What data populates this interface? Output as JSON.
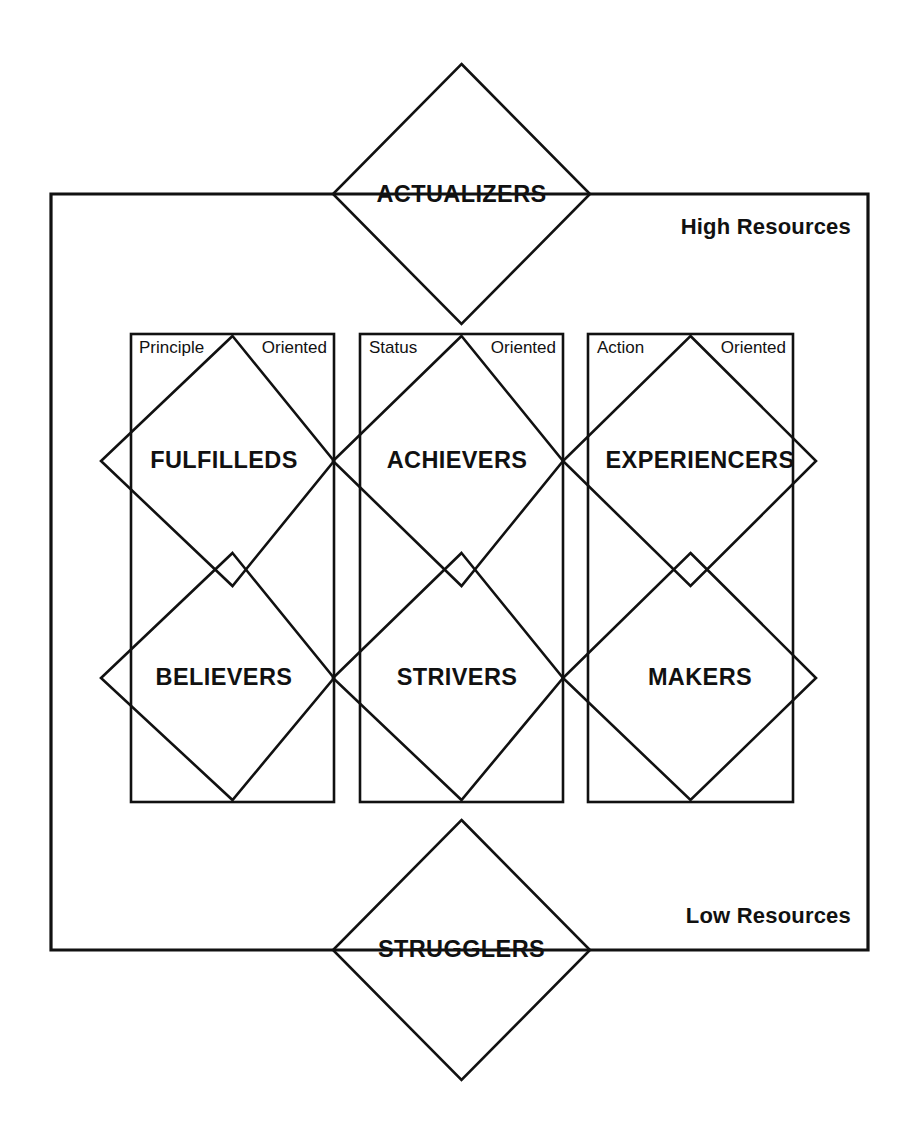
{
  "diagram": {
    "stroke_color": "#111111",
    "background_color": "#ffffff",
    "resources": {
      "high_label": "High Resources",
      "low_label": "Low Resources"
    },
    "apex": {
      "top_label": "ACTUALIZERS",
      "bottom_label": "STRUGGLERS"
    },
    "columns": [
      {
        "id": "principle",
        "orientation_word": "Principle",
        "orientation_suffix": "Oriented"
      },
      {
        "id": "status",
        "orientation_word": "Status",
        "orientation_suffix": "Oriented"
      },
      {
        "id": "action",
        "orientation_word": "Action",
        "orientation_suffix": "Oriented"
      }
    ],
    "segments": {
      "upper_row": [
        "FULFILLEDS",
        "ACHIEVERS",
        "EXPERIENCERS"
      ],
      "lower_row": [
        "BELIEVERS",
        "STRIVERS",
        "MAKERS"
      ]
    }
  }
}
